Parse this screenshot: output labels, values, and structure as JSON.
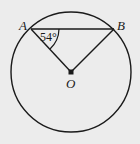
{
  "diagram": {
    "type": "circle-geometry",
    "background": "#ececec",
    "stroke_color": "#1a1a1a",
    "circle": {
      "center_label": "O",
      "cx": 71,
      "cy": 72,
      "r": 60
    },
    "points": [
      {
        "label": "A",
        "x": 31,
        "y": 29
      },
      {
        "label": "B",
        "x": 114,
        "y": 29
      },
      {
        "label": "O",
        "x": 71,
        "y": 72
      }
    ],
    "segments": [
      {
        "from": "A",
        "to": "B",
        "name": "chord AB"
      },
      {
        "from": "A",
        "to": "O",
        "name": "radius OA"
      },
      {
        "from": "B",
        "to": "O",
        "name": "radius OB"
      }
    ],
    "angle_marks": [
      {
        "vertex": "A",
        "between": [
          "B",
          "O"
        ],
        "label": "54°"
      }
    ]
  }
}
